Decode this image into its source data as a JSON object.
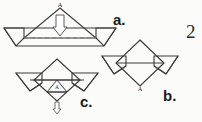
{
  "figure": {
    "caption_labels": {
      "a": "a.",
      "b": "b.",
      "c": "c."
    },
    "page_number": "2",
    "vertex_labels": {
      "fig_a_apex": "A",
      "fig_b_bottom": "A",
      "fig_c_inner": "A"
    },
    "colors": {
      "ink": "#1b1b1b",
      "line": "#3a3a3a",
      "dashed": "#6b6b6b",
      "paper": "#fbfbf9"
    },
    "diagrams": [
      {
        "id": "a",
        "name": "boat-base-step-a",
        "description": "Wide boat-like paper fold: central triangle apex labeled A with a hollow downward arrow inside, horizontal band with a dashed fold line, triangular flaps pointing down at left and right ends.",
        "has_dashed_fold_line": true,
        "arrow_direction": "down",
        "arrow_style": "hollow"
      },
      {
        "id": "b",
        "name": "boat-base-step-b",
        "description": "Diamond (square rotated 45 degrees) with horizontal wings on left and right ending in downward triangular points; bottom vertex labeled A.",
        "has_dashed_fold_line": false,
        "arrow_direction": "none",
        "arrow_style": "none"
      },
      {
        "id": "c",
        "name": "boat-base-step-c",
        "description": "Flattened diamond with wings; a small inner triangle contains label A with a small dashed hollow arrow pointing down below it.",
        "has_dashed_fold_line": true,
        "arrow_direction": "down",
        "arrow_style": "hollow-small"
      }
    ]
  }
}
